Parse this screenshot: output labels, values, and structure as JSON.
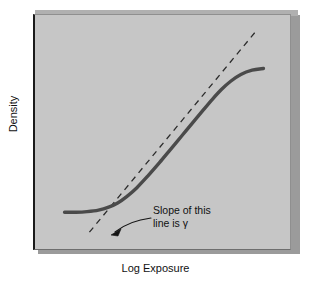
{
  "figure": {
    "background_color": "#ffffff",
    "panel_face_color": "#c6c6c6",
    "panel_shadow_color": "#9b9b9b",
    "panel_border_color": "#1a1a1a",
    "curve_color": "#4a4a4a",
    "dashed_color": "#2b2b2b",
    "text_color": "#111111"
  },
  "axes": {
    "ylabel": "Density",
    "xlabel": "Log Exposure"
  },
  "annotation": {
    "line1": "Slope of this",
    "line2": "line is γ",
    "symbol": "γ"
  },
  "chart_data": {
    "type": "line",
    "title": "",
    "xlabel": "Log Exposure",
    "ylabel": "Density",
    "xlim": [
      0,
      10
    ],
    "ylim": [
      0,
      10
    ],
    "grid": false,
    "legend": null,
    "series": [
      {
        "name": "Characteristic curve (D-log E)",
        "style": "solid",
        "color": "#4a4a4a",
        "width": 3.4,
        "x": [
          0.6,
          1.1,
          1.6,
          2.1,
          2.55,
          2.95,
          3.35,
          3.8,
          4.3,
          4.8,
          5.3,
          5.8,
          6.3,
          6.75,
          7.15,
          7.55,
          7.95,
          8.4,
          8.9,
          9.4
        ],
        "y": [
          1.12,
          1.12,
          1.15,
          1.22,
          1.36,
          1.56,
          1.86,
          2.28,
          2.85,
          3.46,
          4.1,
          4.74,
          5.38,
          5.96,
          6.46,
          6.92,
          7.3,
          7.62,
          7.82,
          7.9
        ]
      },
      {
        "name": "Tangent line through straight-line portion (slope = gamma)",
        "style": "dashed",
        "color": "#2b2b2b",
        "width": 1.3,
        "x": [
          1.7,
          9.1
        ],
        "y": [
          0.18,
          9.7
        ]
      }
    ],
    "annotations": [
      {
        "text": "Slope of this line is γ",
        "target": "tangent-line",
        "leader": "curved-arrow"
      }
    ]
  }
}
